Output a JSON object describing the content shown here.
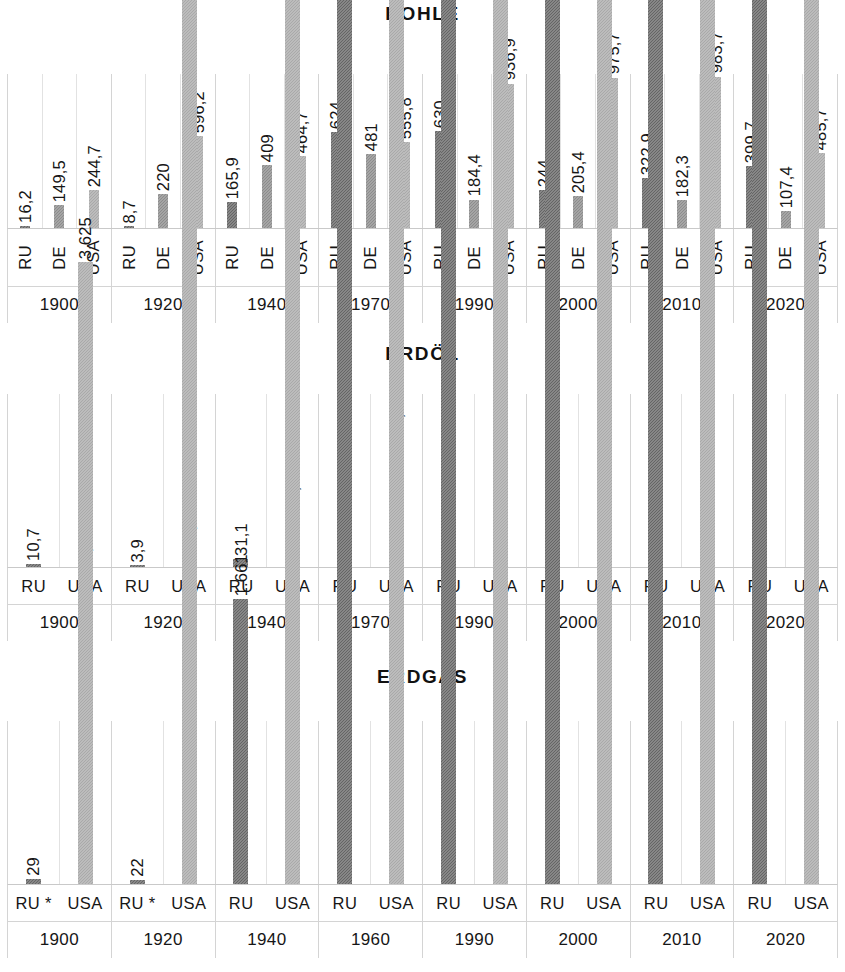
{
  "page": {
    "language": "de"
  },
  "colors": {
    "ru": "#656565",
    "de": "#8c8c8c",
    "usa": "#a9a9a9",
    "gridline": "#d4d4d4",
    "text": "#161616"
  },
  "charts": [
    {
      "id": "kohle",
      "title": "KOHLE",
      "series_labels": [
        "RU",
        "DE",
        "USA"
      ],
      "years": [
        "1900",
        "1920",
        "1940",
        "1970",
        "1990",
        "2000",
        "2010",
        "2020"
      ],
      "label_orientation": "vertical",
      "chart_data": {
        "type": "bar",
        "title": "KOHLE",
        "xlabel": "",
        "ylabel": "",
        "ylim": [
          0,
          1000
        ],
        "grid": true,
        "legend": "none",
        "categories": [
          "1900",
          "1920",
          "1940",
          "1970",
          "1990",
          "2000",
          "2010",
          "2020"
        ],
        "series": [
          {
            "name": "RU",
            "values": [
              16.2,
              8.7,
              165.9,
              624,
              630,
              244,
              322.9,
              399.7
            ],
            "labels": [
              "16,2",
              "8,7",
              "165,9",
              "624",
              "630",
              "244",
              "322,9",
              "399,7"
            ]
          },
          {
            "name": "DE",
            "values": [
              149.5,
              220,
              409,
              481,
              184.4,
              205.4,
              182.3,
              107.4
            ],
            "labels": [
              "149,5",
              "220",
              "409",
              "481",
              "184,4",
              "205,4",
              "182,3",
              "107,4"
            ]
          },
          {
            "name": "USA",
            "values": [
              244.7,
              596.2,
              464.7,
              555.8,
              936.9,
              975.7,
              983.7,
              485.7
            ],
            "labels": [
              "244,7",
              "596,2",
              "464,7",
              "555,8",
              "936,9",
              "975,7",
              "983,7",
              "485,7"
            ]
          }
        ]
      }
    },
    {
      "id": "erdoel",
      "title": "ERDÖL",
      "series_labels": [
        "RU",
        "USA"
      ],
      "years": [
        "1900",
        "1920",
        "1940",
        "1970",
        "1990",
        "2000",
        "2010",
        "2020"
      ],
      "label_orientation": "horizontal",
      "chart_data": {
        "type": "bar",
        "title": "ERDÖL",
        "xlabel": "",
        "ylabel": "",
        "ylim": [
          0,
          700
        ],
        "grid": true,
        "legend": "none",
        "categories": [
          "1900",
          "1920",
          "1940",
          "1970",
          "1990",
          "2000",
          "2010",
          "2020"
        ],
        "series": [
          {
            "name": "RU",
            "values": [
              10.7,
              3.9,
              31.1,
              353,
              524,
              322,
              504,
              513
            ],
            "labels": [
              "10,7",
              "3,9",
              "31,1",
              "353",
              "524",
              "322",
              "504",
              "513"
            ]
          },
          {
            "name": "USA",
            "values": [
              8.5,
              62.1,
              182.9,
              475.3,
              413,
              353,
              334,
              685
            ],
            "labels": [
              "8,5",
              "62,1",
              "182,9",
              "475,3",
              "413",
              "353",
              "334",
              "685"
            ]
          }
        ]
      }
    },
    {
      "id": "erdgas",
      "title": "ERDGAS",
      "series_labels": [
        "RU",
        "USA"
      ],
      "series_labels_by_year": [
        [
          "RU *",
          "USA"
        ],
        [
          "RU *",
          "USA"
        ],
        [
          "RU",
          "USA"
        ],
        [
          "RU",
          "USA"
        ],
        [
          "RU",
          "USA"
        ],
        [
          "RU",
          "USA"
        ],
        [
          "RU",
          "USA"
        ],
        [
          "RU",
          "USA"
        ]
      ],
      "years": [
        "1900",
        "1920",
        "1940",
        "1960",
        "1990",
        "2000",
        "2010",
        "2020"
      ],
      "label_orientation": "horizontal",
      "chart_data": {
        "type": "bar",
        "title": "ERDGAS",
        "xlabel": "",
        "ylabel": "",
        "ylim": [
          0,
          950
        ],
        "grid": true,
        "legend": "none",
        "categories": [
          "1900",
          "1920",
          "1940",
          "1960",
          "1990",
          "2000",
          "2010",
          "2020"
        ],
        "series": [
          {
            "name": "RU",
            "values": [
              29,
              22,
              1661,
              45303,
              599589,
              537056,
              598386,
              637294
            ],
            "labels": [
              "29",
              "22",
              "1.661",
              "45.303",
              "599.589",
              "537.056",
              "598.386",
              "637.294"
            ]
          },
          {
            "name": "USA",
            "values": [
              3625,
              22993,
              77418,
              361634,
              483377,
              518600,
              575157,
              915899
            ],
            "labels": [
              "3.625",
              "22.993",
              "77.418",
              "361.634",
              "483.377",
              "518.600",
              "575.157",
              "915.899"
            ]
          }
        ]
      }
    }
  ]
}
